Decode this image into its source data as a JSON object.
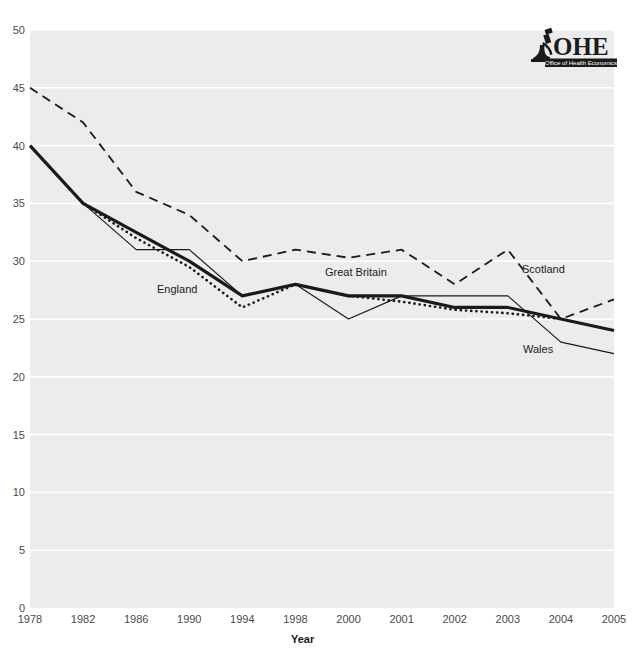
{
  "logo": {
    "name": "ohe-logo",
    "acronym": "OHE",
    "tagline": "Office of Health Economics",
    "icon": "microscope-icon"
  },
  "axes": {
    "x_title": "Year",
    "x_ticks": [
      "1978",
      "1982",
      "1986",
      "1990",
      "1994",
      "1998",
      "2000",
      "2001",
      "2002",
      "2003",
      "2004",
      "2005"
    ],
    "y_ticks": [
      "50",
      "45",
      "40",
      "35",
      "30",
      "25",
      "20",
      "15",
      "10",
      "5",
      "0"
    ]
  },
  "series_labels": {
    "england": "England",
    "great_britain": "Great Britain",
    "scotland": "Scotland",
    "wales": "Wales"
  },
  "colors": {
    "plot_background": "#ececec",
    "gridline": "#ffffff",
    "line": "#1a1a1a",
    "tick_text": "#4a4a4a"
  },
  "chart_data": {
    "type": "line",
    "title": "",
    "subtitle": "",
    "xlabel": "Year",
    "ylabel": "",
    "x": [
      "1978",
      "1982",
      "1986",
      "1990",
      "1994",
      "1998",
      "2000",
      "2001",
      "2002",
      "2003",
      "2004",
      "2005"
    ],
    "xlim": [
      0,
      11
    ],
    "ylim": [
      0,
      50
    ],
    "ytick_step": 5,
    "grid": "horizontal",
    "legend": "inline-annotations",
    "legend_position": "inside-plot",
    "series": [
      {
        "name": "Great Britain",
        "style": "thick-solid",
        "values": [
          40,
          35,
          32.5,
          30,
          27,
          28,
          27,
          27,
          26,
          26,
          25,
          24
        ]
      },
      {
        "name": "England",
        "style": "dotted",
        "values": [
          null,
          35,
          32,
          29.5,
          26,
          28,
          27,
          26.5,
          25.8,
          25.5,
          25,
          null
        ]
      },
      {
        "name": "Scotland",
        "style": "dashed",
        "values": [
          45,
          42,
          36,
          34,
          30,
          31,
          30.3,
          31,
          28,
          31,
          25,
          26.7
        ]
      },
      {
        "name": "Wales",
        "style": "thin-solid",
        "values": [
          null,
          35,
          31,
          31,
          27,
          28,
          25,
          27,
          27,
          27,
          23,
          22
        ]
      }
    ]
  }
}
